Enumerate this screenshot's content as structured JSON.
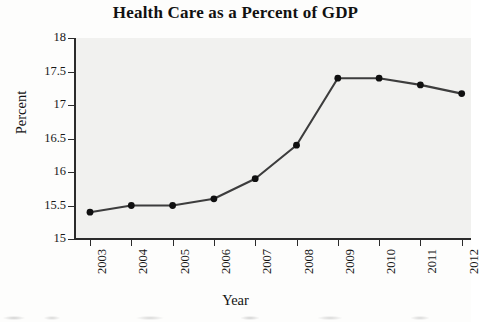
{
  "chart_data": {
    "type": "line",
    "title": "Health Care as a Percent of GDP",
    "xlabel": "Year",
    "ylabel": "Percent",
    "categories": [
      "2003",
      "2004",
      "2005",
      "2006",
      "2007",
      "2008",
      "2009",
      "2010",
      "2011",
      "2012"
    ],
    "values": [
      15.4,
      15.5,
      15.5,
      15.6,
      15.9,
      16.4,
      17.4,
      17.4,
      17.3,
      17.17
    ],
    "series": [
      {
        "name": "Health care share of GDP",
        "values": [
          15.4,
          15.5,
          15.5,
          15.6,
          15.9,
          16.4,
          17.4,
          17.4,
          17.3,
          17.17
        ]
      }
    ],
    "ylim": [
      15,
      18
    ],
    "ytick_labels": [
      "15",
      "15.5",
      "16",
      "16.5",
      "17",
      "17.5",
      "18"
    ],
    "ytick_values": [
      15,
      15.5,
      16,
      16.5,
      17,
      17.5,
      18
    ],
    "xtick_labels": [
      "2003",
      "2004",
      "2005",
      "2006",
      "2007",
      "2008",
      "2009",
      "2010",
      "2011",
      "2012"
    ],
    "xtick_rotation": "90",
    "grid": "off",
    "legend": "none",
    "marker": "filled-circle",
    "line_color": "#3d3d3d",
    "marker_color": "#101010",
    "plot_background": "#f1f1ef",
    "axis_color": "#2b2b2b"
  }
}
